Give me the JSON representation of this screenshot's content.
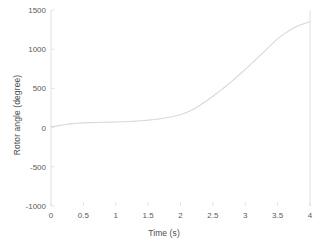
{
  "chart_data": {
    "type": "line",
    "title": "",
    "xlabel": "Time (s)",
    "ylabel": "Rotor angle (degree)",
    "xlim": [
      0,
      4
    ],
    "ylim": [
      -1000,
      1500
    ],
    "xticks": [
      0,
      0.5,
      1,
      1.5,
      2,
      2.5,
      3,
      3.5,
      4
    ],
    "xticklabels": [
      "0",
      "0.5",
      "1",
      "1.5",
      "2",
      "2.5",
      "3",
      "3.5",
      "4"
    ],
    "yticks": [
      -1000,
      -500,
      0,
      500,
      1000,
      1500
    ],
    "yticklabels": [
      "-1000",
      "-500",
      "0",
      "500",
      "1000",
      "1500"
    ],
    "grid": false,
    "legend": null,
    "line_color": "#d8d8d8",
    "axis_color": "#e2e2e2",
    "series": [
      {
        "name": "Rotor angle",
        "x": [
          0,
          0.1,
          0.2,
          0.3,
          0.4,
          0.5,
          0.6,
          0.7,
          0.8,
          0.9,
          1.0,
          1.1,
          1.2,
          1.3,
          1.4,
          1.5,
          1.6,
          1.7,
          1.8,
          1.9,
          2.0,
          2.1,
          2.2,
          2.3,
          2.4,
          2.5,
          2.6,
          2.7,
          2.8,
          2.9,
          3.0,
          3.1,
          3.2,
          3.3,
          3.4,
          3.5,
          3.6,
          3.7,
          3.8,
          3.9,
          4.0
        ],
        "values": [
          10,
          22,
          36,
          48,
          55,
          60,
          63,
          66,
          68,
          70,
          72,
          75,
          78,
          82,
          88,
          95,
          104,
          115,
          128,
          145,
          165,
          195,
          235,
          285,
          340,
          400,
          462,
          528,
          596,
          668,
          742,
          818,
          896,
          975,
          1055,
          1135,
          1195,
          1248,
          1292,
          1325,
          1350
        ]
      }
    ]
  },
  "axes": {
    "right_spine_visible": true,
    "left_spine_visible": true,
    "top_spine_visible": false,
    "bottom_spine_visible": false
  }
}
